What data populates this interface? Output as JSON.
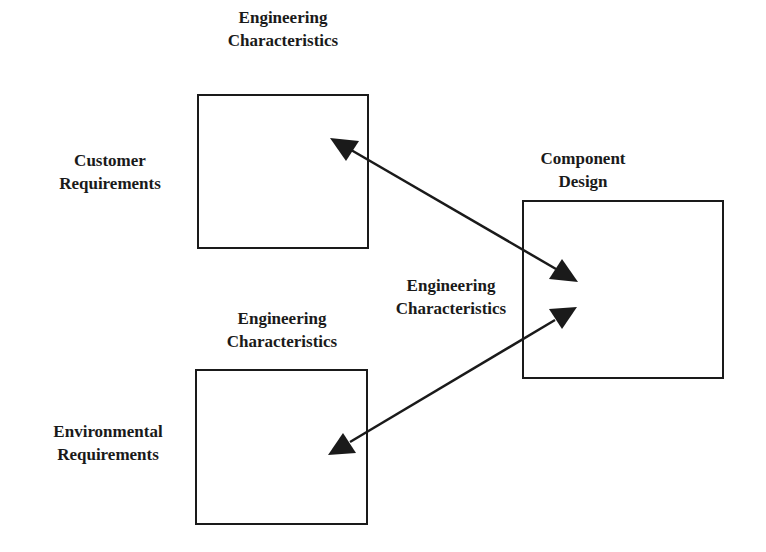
{
  "diagram": {
    "colors": {
      "stroke": "#1a1a1a",
      "background": "#ffffff"
    },
    "labels": {
      "top_box_header": {
        "line1": "Engineering",
        "line2": "Characteristics"
      },
      "customer_requirements": {
        "line1": "Customer",
        "line2": "Requirements"
      },
      "component_design": {
        "line1": "Component",
        "line2": "Design"
      },
      "middle_engineering": {
        "line1": "Engineering",
        "line2": "Characteristics"
      },
      "bottom_box_header": {
        "line1": "Engineering",
        "line2": "Characteristics"
      },
      "environmental_requirements": {
        "line1": "Environmental",
        "line2": "Requirements"
      }
    },
    "nodes": [
      {
        "id": "customer-matrix",
        "row_label": "Customer Requirements",
        "column_label": "Engineering Characteristics"
      },
      {
        "id": "environmental-matrix",
        "row_label": "Environmental Requirements",
        "column_label": "Engineering Characteristics"
      },
      {
        "id": "component-design",
        "label": "Component Design"
      }
    ],
    "edges": [
      {
        "from": "customer-matrix",
        "to": "component-design",
        "type": "bidirectional"
      },
      {
        "from": "environmental-matrix",
        "to": "component-design",
        "type": "bidirectional",
        "label": "Engineering Characteristics"
      }
    ]
  }
}
